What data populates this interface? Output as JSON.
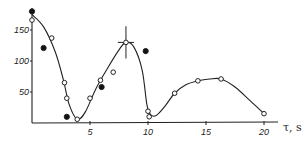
{
  "chart_data": {
    "type": "scatter",
    "title": "",
    "xlabel": "τ, s",
    "ylabel": "",
    "xlim": [
      0,
      21
    ],
    "ylim": [
      0,
      185
    ],
    "grid": false,
    "legend": "none",
    "x_ticks": [
      5,
      10,
      15,
      20
    ],
    "x_tick_labels": [
      "5",
      "10",
      "15",
      "20"
    ],
    "y_ticks": [
      50,
      100,
      150
    ],
    "y_tick_labels": [
      "50",
      "100",
      "150"
    ],
    "series": [
      {
        "name": "open circles",
        "marker": "open-circle",
        "points": [
          [
            0.0,
            166
          ],
          [
            1.7,
            137
          ],
          [
            2.8,
            65
          ],
          [
            3.0,
            40
          ],
          [
            3.9,
            6
          ],
          [
            5.0,
            40
          ],
          [
            5.9,
            69
          ],
          [
            7.0,
            82
          ],
          [
            8.1,
            130
          ],
          [
            10.0,
            19
          ],
          [
            10.1,
            10
          ],
          [
            12.3,
            48
          ],
          [
            14.3,
            68
          ],
          [
            16.3,
            71
          ],
          [
            20.0,
            15
          ]
        ]
      },
      {
        "name": "filled circles",
        "marker": "filled-circle",
        "points": [
          [
            0.0,
            180
          ],
          [
            1.0,
            121
          ],
          [
            3.0,
            10
          ],
          [
            6.0,
            58
          ],
          [
            9.8,
            116
          ]
        ]
      },
      {
        "name": "fitted curve",
        "marker": "line",
        "points": [
          [
            0.0,
            175
          ],
          [
            1.0,
            155
          ],
          [
            2.0,
            115
          ],
          [
            2.7,
            70
          ],
          [
            3.2,
            30
          ],
          [
            3.9,
            6
          ],
          [
            4.6,
            18
          ],
          [
            5.5,
            55
          ],
          [
            6.5,
            88
          ],
          [
            7.5,
            118
          ],
          [
            8.1,
            130
          ],
          [
            8.8,
            122
          ],
          [
            9.5,
            85
          ],
          [
            9.9,
            30
          ],
          [
            10.2,
            14
          ],
          [
            10.7,
            12
          ],
          [
            11.5,
            28
          ],
          [
            12.3,
            48
          ],
          [
            13.3,
            62
          ],
          [
            14.3,
            68
          ],
          [
            15.3,
            71
          ],
          [
            16.3,
            71
          ],
          [
            17.5,
            58
          ],
          [
            18.8,
            36
          ],
          [
            20.0,
            15
          ]
        ]
      }
    ],
    "annotations": [
      {
        "type": "error-bar",
        "x": 8.1,
        "y": 130,
        "x_err": 0.7,
        "y_err": 26
      }
    ]
  }
}
